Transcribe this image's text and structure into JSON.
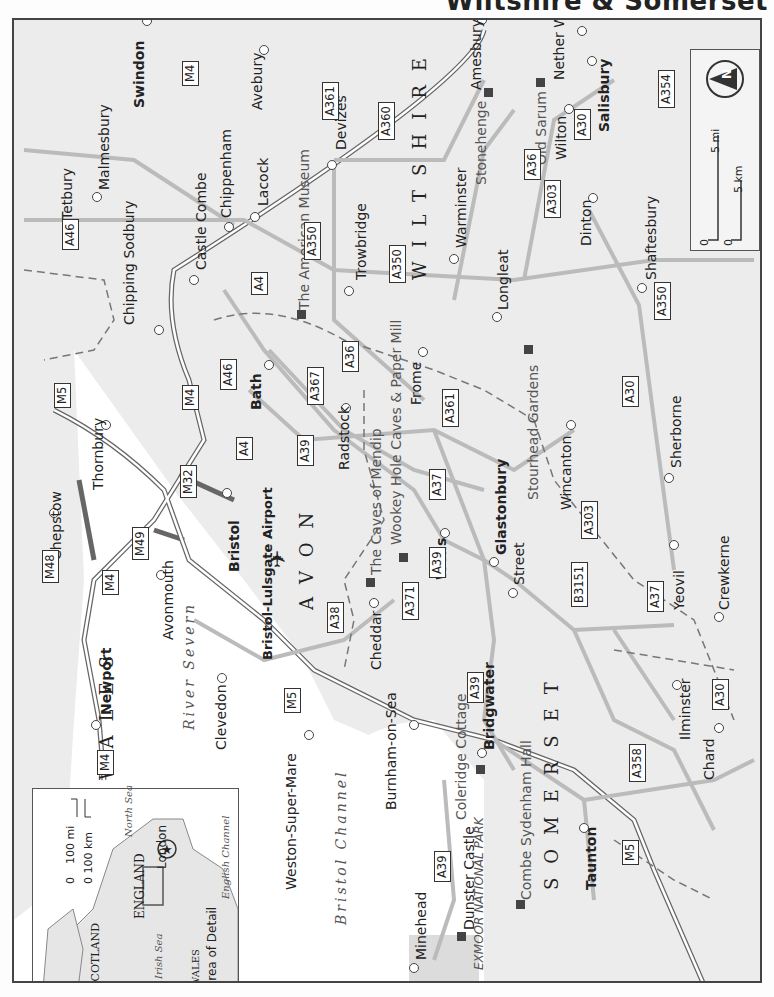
{
  "header": {
    "title": "Wiltshire & Somerset"
  },
  "map": {
    "orientation": "rotated 90° counter-clockwise",
    "regions": [
      {
        "name": "WALES"
      },
      {
        "name": "AVON"
      },
      {
        "name": "WILTSHIRE"
      },
      {
        "name": "SOMERSET"
      }
    ],
    "water": [
      {
        "name": "River Severn"
      },
      {
        "name": "Bristol Channel"
      }
    ],
    "towns": [
      {
        "name": "Swindon",
        "bold": true
      },
      {
        "name": "Avebury",
        "bold": false
      },
      {
        "name": "Amesbury",
        "bold": false
      },
      {
        "name": "Nether Wallop",
        "bold": false
      },
      {
        "name": "Salisbury",
        "bold": true
      },
      {
        "name": "Malmesbury",
        "bold": false
      },
      {
        "name": "Tetbury",
        "bold": false
      },
      {
        "name": "Chippenham",
        "bold": false
      },
      {
        "name": "Castle Combe",
        "bold": false
      },
      {
        "name": "Lacock",
        "bold": false
      },
      {
        "name": "Devizes",
        "bold": false
      },
      {
        "name": "Trowbridge",
        "bold": false
      },
      {
        "name": "Warminster",
        "bold": false
      },
      {
        "name": "Wilton",
        "bold": false
      },
      {
        "name": "Dinton",
        "bold": false
      },
      {
        "name": "Shaftesbury",
        "bold": false
      },
      {
        "name": "Chipping Sodbury",
        "bold": false
      },
      {
        "name": "Bath",
        "bold": true
      },
      {
        "name": "Radstock",
        "bold": false
      },
      {
        "name": "Frome",
        "bold": false
      },
      {
        "name": "Longleat",
        "bold": false
      },
      {
        "name": "Thornbury",
        "bold": false
      },
      {
        "name": "Chepstow",
        "bold": false
      },
      {
        "name": "Bristol",
        "bold": true
      },
      {
        "name": "Avonmouth",
        "bold": false
      },
      {
        "name": "Wells",
        "bold": true
      },
      {
        "name": "Glastonbury",
        "bold": true
      },
      {
        "name": "Wincanton",
        "bold": false
      },
      {
        "name": "Sherborne",
        "bold": false
      },
      {
        "name": "Newport",
        "bold": true
      },
      {
        "name": "Clevedon",
        "bold": false
      },
      {
        "name": "Cheddar",
        "bold": false
      },
      {
        "name": "Street",
        "bold": false
      },
      {
        "name": "Yeovil",
        "bold": false
      },
      {
        "name": "Crewkerne",
        "bold": false
      },
      {
        "name": "Ilminster",
        "bold": false
      },
      {
        "name": "Weston-Super-Mare",
        "bold": false
      },
      {
        "name": "Burnham-on-Sea",
        "bold": false
      },
      {
        "name": "Bridgwater",
        "bold": true
      },
      {
        "name": "Chard",
        "bold": false
      },
      {
        "name": "Taunton",
        "bold": true
      },
      {
        "name": "Minehead",
        "bold": false
      }
    ],
    "sights": [
      {
        "name": "Stonehenge"
      },
      {
        "name": "Old Sarum"
      },
      {
        "name": "The American Museum"
      },
      {
        "name": "The Caves of Mendip"
      },
      {
        "name": "Wookey Hole Caves & Paper Mill"
      },
      {
        "name": "Stourhead Gardens"
      },
      {
        "name": "Coleridge Cottage"
      },
      {
        "name": "Combe Sydenham Hall"
      },
      {
        "name": "Dunster Castle"
      }
    ],
    "airport": {
      "name": "Bristol-Lulsgate Airport"
    },
    "park": {
      "name": "EXMOOR NATIONAL PARK"
    },
    "roads": [
      "M4",
      "M5",
      "M32",
      "M48",
      "M49",
      "A4",
      "A30",
      "A36",
      "A37",
      "A38",
      "A39",
      "A46",
      "A303",
      "A350",
      "A354",
      "A358",
      "A360",
      "A361",
      "A367",
      "A371",
      "B3151"
    ]
  },
  "scale": {
    "miles": "5 mi",
    "km": "5 km",
    "zero": "0"
  },
  "inset": {
    "labels": [
      "SCOTLAND",
      "ENGLAND",
      "WALES",
      "London",
      "North Sea",
      "Irish Sea",
      "English Channel",
      "Area of Detail"
    ],
    "scale_mi": "100 mi",
    "scale_km": "0 100 km",
    "scale_zero": "0"
  }
}
